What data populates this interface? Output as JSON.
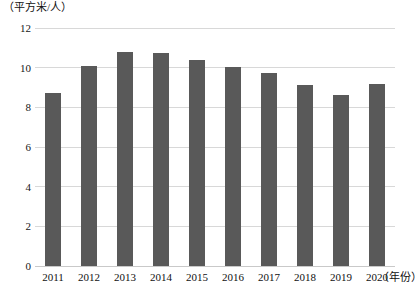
{
  "chart_data": {
    "type": "bar",
    "title": "",
    "subtitle": "",
    "xlabel": "（年份）",
    "ylabel": "（平方米/人）",
    "categories": [
      "2011",
      "2012",
      "2013",
      "2014",
      "2015",
      "2016",
      "2017",
      "2018",
      "2019",
      "2020"
    ],
    "values": [
      8.7,
      10.1,
      10.8,
      10.75,
      10.4,
      10.05,
      9.75,
      9.15,
      8.6,
      9.2
    ],
    "series": [
      {
        "name": "人均面积",
        "values": [
          8.7,
          10.1,
          10.8,
          10.75,
          10.4,
          10.05,
          9.75,
          9.15,
          8.6,
          9.2
        ]
      }
    ],
    "ylim": [
      0,
      12
    ],
    "yticks": [
      0,
      2,
      4,
      6,
      8,
      10,
      12
    ],
    "ytick_labels": [
      "0",
      "2",
      "4",
      "6",
      "8",
      "10",
      "12"
    ],
    "grid": true,
    "grid_axis": "y",
    "legend": false,
    "legend_position": "none",
    "bar_color": "#595959",
    "gridline_color": "#d8d8d8",
    "background_color": "#ffffff"
  }
}
